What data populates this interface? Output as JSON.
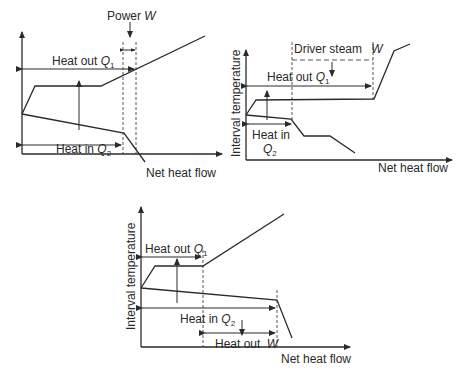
{
  "panels": [
    {
      "id": "top-left",
      "xlabel": "Net heat flow",
      "ylabel": "Interval temperature",
      "heat_out": {
        "text": "Heat out ",
        "sym": "Q",
        "sub": "1"
      },
      "heat_in": {
        "text": "Heat in ",
        "sym": "Q",
        "sub": "2"
      },
      "power": {
        "text": "Power ",
        "sym": "W"
      }
    },
    {
      "id": "top-right",
      "xlabel": "Net heat flow",
      "ylabel": "Interval temperature",
      "driver": {
        "text": "Driver steam ",
        "sym": "W"
      },
      "heat_out": {
        "text": "Heat out ",
        "sym": "Q",
        "sub": "1"
      },
      "heat_in": {
        "text": "Heat in",
        "sym": "Q",
        "sub": "2"
      }
    },
    {
      "id": "bottom",
      "xlabel": "Net heat flow",
      "ylabel": "Interval temperature",
      "heat_out": {
        "text": "Heat out ",
        "sym": "Q",
        "sub": "1"
      },
      "heat_in": {
        "text": "Heat in ",
        "sym": "Q",
        "sub": "2"
      },
      "heat_out_w": {
        "text": "Heat out ",
        "sym": "W"
      }
    }
  ]
}
